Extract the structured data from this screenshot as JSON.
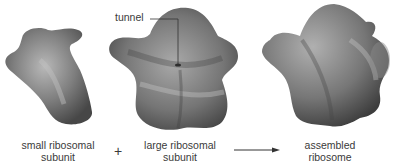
{
  "diagram": {
    "type": "ribosome-assembly",
    "components": [
      {
        "id": "small",
        "label_line1": "small ribosomal",
        "label_line2": "subunit"
      },
      {
        "id": "large",
        "label_line1": "large ribosomal",
        "label_line2": "subunit"
      },
      {
        "id": "assembled",
        "label_line1": "assembled",
        "label_line2": "ribosome"
      }
    ],
    "operator": "+",
    "callout": "tunnel",
    "colors": {
      "shape": "#7a7a7a",
      "shape_dark": "#3e3e3e",
      "shape_light": "#b5b5b5",
      "text": "#3a3a3a"
    }
  }
}
